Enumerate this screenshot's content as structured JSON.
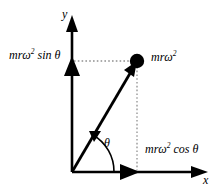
{
  "figure": {
    "type": "vector-decomposition-diagram",
    "background_color": "#ffffff",
    "stroke_color": "#000000",
    "dotted_color": "#808080",
    "axes": {
      "x_label": "x",
      "y_label": "y",
      "origin": {
        "x": 72,
        "y": 172
      },
      "x_end": {
        "x": 207,
        "y": 172
      },
      "y_end": {
        "x": 72,
        "y": 16
      }
    },
    "vector": {
      "label": "mrω",
      "exponent": "2",
      "tip": {
        "x": 137,
        "y": 61
      },
      "tail": {
        "x": 72,
        "y": 172
      },
      "point_marker": "filled-circle",
      "point_radius": 7
    },
    "components": {
      "y_component": {
        "label_prefix": "mrω",
        "label_exponent": "2",
        "label_suffix": " sin θ",
        "full_text": "mrω² sin θ",
        "axis": "y",
        "value_position": {
          "x": 72,
          "y": 61
        }
      },
      "x_component": {
        "label_prefix": "mrω",
        "label_exponent": "2",
        "label_suffix": " cos θ",
        "full_text": "mrω² cos θ",
        "axis": "x",
        "value_position": {
          "x": 137,
          "y": 172
        }
      }
    },
    "angle": {
      "label": "θ",
      "arc_radius": 42,
      "from_degrees": 0,
      "to_degrees": 60,
      "arrow_direction": "counterclockwise"
    }
  }
}
